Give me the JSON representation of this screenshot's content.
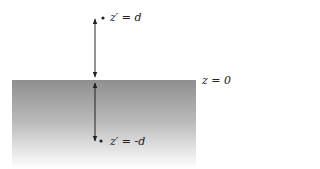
{
  "diagram": {
    "boundary_label": "z = 0",
    "source_label": "z′ = d",
    "image_label": "z′ = -d",
    "colors": {
      "region_top": "#8f8f8f",
      "region_bottom": "#ffffff",
      "line": "#222222"
    }
  }
}
